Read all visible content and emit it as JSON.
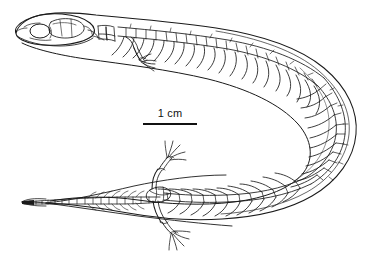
{
  "figure": {
    "domain": "natural-image",
    "view": "dorsal",
    "background_color": "#ffffff",
    "ink_color": "#1a1a1a",
    "title": "",
    "caption": "",
    "scale": {
      "label": "1 cm",
      "bar_length_px": 54,
      "bar_x_px": 143,
      "bar_y_px": 123,
      "label_x_px": 143,
      "label_y_px": 107,
      "bar_color": "#111111"
    },
    "anatomy": [
      {
        "name": "skull",
        "label": "skull",
        "x_px": 45,
        "y_px": 28
      },
      {
        "name": "orbit",
        "label": "orbit",
        "x_px": 38,
        "y_px": 30
      },
      {
        "name": "cervical-vertebrae",
        "label": "cervical vertebrae",
        "x_px": 85,
        "y_px": 22
      },
      {
        "name": "forelimb",
        "label": "vestigial forelimb",
        "x_px": 135,
        "y_px": 55
      },
      {
        "name": "dorsal-vertebrae",
        "label": "dorsal vertebrae with ribs",
        "x_px": 230,
        "y_px": 35
      },
      {
        "name": "body-curve",
        "label": "curved trunk",
        "x_px": 330,
        "y_px": 110
      },
      {
        "name": "pelvic-girdle",
        "label": "pelvic girdle",
        "x_px": 150,
        "y_px": 196
      },
      {
        "name": "hindlimb-upper",
        "label": "hindlimb",
        "x_px": 158,
        "y_px": 172
      },
      {
        "name": "hindlimb-lower",
        "label": "hindlimb",
        "x_px": 165,
        "y_px": 218
      },
      {
        "name": "caudal-vertebrae",
        "label": "caudal vertebrae",
        "x_px": 95,
        "y_px": 200
      },
      {
        "name": "tail-tip",
        "label": "tail tip",
        "x_px": 30,
        "y_px": 202
      }
    ]
  }
}
